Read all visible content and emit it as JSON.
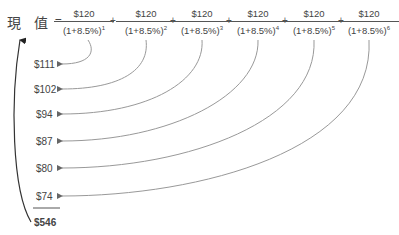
{
  "title": {
    "char1": "現",
    "char2": "值",
    "equals": "="
  },
  "fractions": [
    {
      "numerator": "$120",
      "base": "(1+8.5%)",
      "exp": "1"
    },
    {
      "numerator": "$120",
      "base": "(1+8.5%)",
      "exp": "2"
    },
    {
      "numerator": "$120",
      "base": "(1+8.5%)",
      "exp": "3"
    },
    {
      "numerator": "$120",
      "base": "(1+8.5%)",
      "exp": "4"
    },
    {
      "numerator": "$120",
      "base": "(1+8.5%)",
      "exp": "5"
    },
    {
      "numerator": "$120",
      "base": "(1+8.5%)",
      "exp": "6"
    }
  ],
  "operator": "+",
  "values": [
    "$111",
    "$102",
    "$94",
    "$87",
    "$80",
    "$74"
  ],
  "total": "$546",
  "colors": {
    "line": "#888888",
    "text": "#444444"
  }
}
